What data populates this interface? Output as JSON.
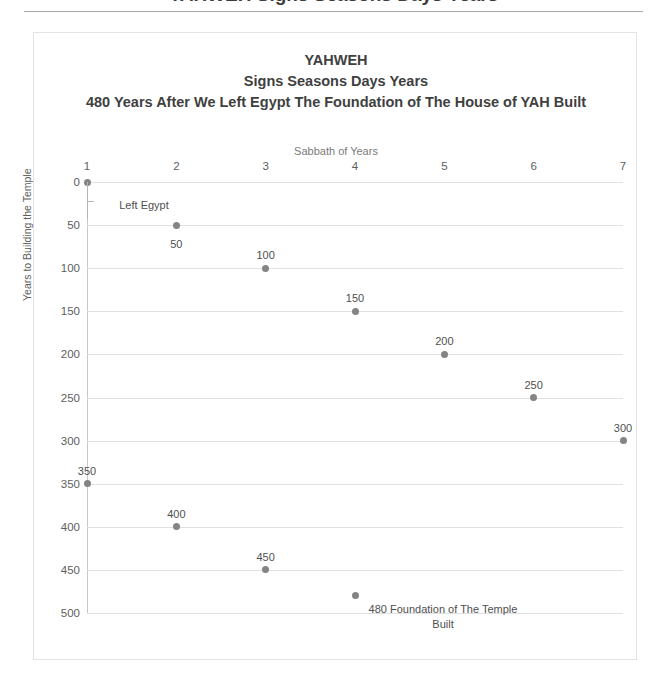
{
  "cropped_heading": "YAHWEH Signs Seasons Days Years",
  "chart_data": {
    "type": "scatter",
    "title_lines": [
      "YAHWEH",
      "Signs Seasons Days Years",
      "480 Years After We Left Egypt The Foundation of The House of YAH Built"
    ],
    "title": "YAHWEH Signs Seasons Days Years 480 Years After We Left Egypt The Foundation of The House of YAH Built",
    "xlabel": "Sabbath of Years",
    "ylabel": "Years to Building the Temple",
    "xlim": [
      1,
      7
    ],
    "ylim": [
      0,
      500
    ],
    "y_inverted": true,
    "grid": true,
    "legend": "none",
    "x_ticks": [
      "1",
      "2",
      "3",
      "4",
      "5",
      "6",
      "7"
    ],
    "y_ticks": [
      "0",
      "50",
      "100",
      "150",
      "200",
      "250",
      "300",
      "350",
      "400",
      "450",
      "500"
    ],
    "marker_color": "#848484",
    "gridline_color": "#e0e0e0",
    "points": [
      {
        "x": 1,
        "y": 0,
        "label": "Left Egypt",
        "label_style": "leader"
      },
      {
        "x": 2,
        "y": 50,
        "label": "50",
        "label_style": "below"
      },
      {
        "x": 3,
        "y": 100,
        "label": "100",
        "label_style": "above"
      },
      {
        "x": 4,
        "y": 150,
        "label": "150",
        "label_style": "above"
      },
      {
        "x": 5,
        "y": 200,
        "label": "200",
        "label_style": "above"
      },
      {
        "x": 6,
        "y": 250,
        "label": "250",
        "label_style": "above"
      },
      {
        "x": 7,
        "y": 300,
        "label": "300",
        "label_style": "above"
      },
      {
        "x": 1,
        "y": 350,
        "label": "350",
        "label_style": "above"
      },
      {
        "x": 2,
        "y": 400,
        "label": "400",
        "label_style": "above"
      },
      {
        "x": 3,
        "y": 450,
        "label": "450",
        "label_style": "above"
      },
      {
        "x": 4,
        "y": 480,
        "label": "480 Foundation of The Temple Built",
        "label_style": "right-multiline"
      }
    ]
  }
}
